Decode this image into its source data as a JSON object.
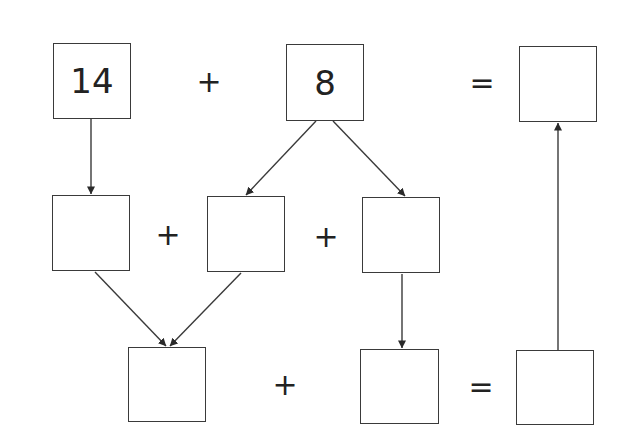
{
  "diagram": {
    "type": "number-decomposition-flow",
    "row1": {
      "left_value": "14",
      "operator1": "+",
      "right_value": "8",
      "operator2": "=",
      "result_value": ""
    },
    "row2": {
      "box_a": "",
      "operator1": "+",
      "box_b": "",
      "operator2": "+",
      "box_c": ""
    },
    "row3": {
      "box_d": "",
      "operator1": "+",
      "box_e": "",
      "operator2": "=",
      "box_f": ""
    },
    "arrows": [
      {
        "from": "14",
        "to": "row2.box_a"
      },
      {
        "from": "8",
        "to": "row2.box_b"
      },
      {
        "from": "8",
        "to": "row2.box_c"
      },
      {
        "from": "row2.box_a",
        "to": "row3.box_d"
      },
      {
        "from": "row2.box_b",
        "to": "row3.box_d"
      },
      {
        "from": "row2.box_c",
        "to": "row3.box_e"
      },
      {
        "from": "row3.box_f",
        "to": "row1.result"
      }
    ],
    "colors": {
      "stroke": "#3a3a3a",
      "text": "#222222",
      "background": "#ffffff"
    }
  }
}
